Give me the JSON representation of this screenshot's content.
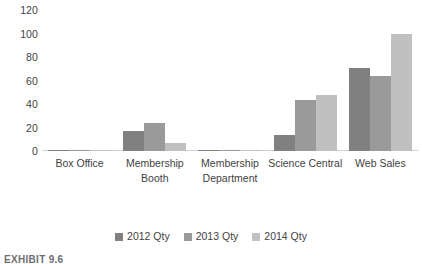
{
  "chart_data": {
    "type": "bar",
    "title": "",
    "xlabel": "",
    "ylabel": "",
    "ylim": [
      0,
      120
    ],
    "yticks": [
      120,
      100,
      80,
      60,
      40,
      20,
      0
    ],
    "grid": false,
    "legend_position": "bottom",
    "categories": [
      "Box Office",
      "Membership Booth",
      "Membership Department",
      "Science Central",
      "Web Sales"
    ],
    "series": [
      {
        "name": "2012 Qty",
        "color": "#808080",
        "values": [
          1,
          17,
          1,
          14,
          71
        ]
      },
      {
        "name": "2013 Qty",
        "color": "#9a9a9a",
        "values": [
          0,
          24,
          0,
          43,
          64
        ]
      },
      {
        "name": "2014 Qty",
        "color": "#c0c0c0",
        "values": [
          1,
          7,
          1,
          48,
          100
        ]
      }
    ]
  },
  "caption": {
    "text": "EXHIBIT 9.6"
  }
}
